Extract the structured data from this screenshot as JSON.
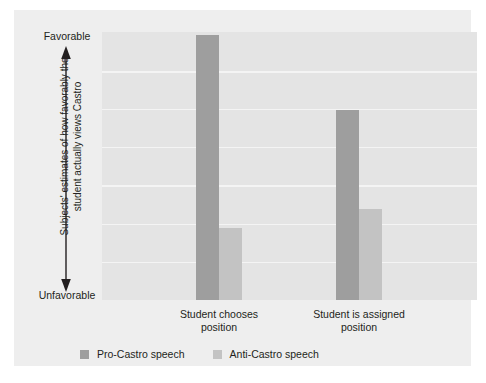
{
  "chart_data": {
    "type": "bar",
    "title": "",
    "subtitle": "",
    "xlabel": "",
    "ylabel": "Subjects' estimates of how favorably the student actually views Castro",
    "categories": [
      "Student chooses position",
      "Student is assigned position"
    ],
    "category_lines": [
      [
        "Student chooses",
        "position"
      ],
      [
        "Student is assigned",
        "position"
      ]
    ],
    "series": [
      {
        "name": "Pro-Castro speech",
        "color": "#9e9e9e",
        "values": [
          99,
          71
        ]
      },
      {
        "name": "Anti-Castro speech",
        "color": "#c3c3c3",
        "values": [
          27,
          34
        ]
      }
    ],
    "ylim": [
      0,
      100
    ],
    "y_axis_top_label": "Favorable",
    "y_axis_bottom_label": "Unfavorable",
    "y_tick_labels": [],
    "grid": true,
    "gridline_count": 6,
    "gridline_positions_pct": [
      85.8,
      71.6,
      57.1,
      42.9,
      28.7,
      14.6
    ],
    "legend_position": "bottom-left",
    "plot_background": "#e4e4e4",
    "figure_background": "#eeeeee",
    "gridline_color": "#f4f4f4",
    "text_color": "#231f20"
  },
  "legend": {
    "entries": [
      {
        "label": "Pro-Castro speech"
      },
      {
        "label": "Anti-Castro speech"
      }
    ]
  }
}
